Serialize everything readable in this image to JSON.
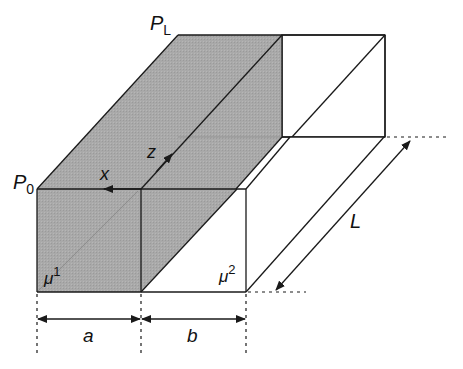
{
  "diagram": {
    "type": "isometric-box-two-regions",
    "colors": {
      "shaded": "#a9a9a9",
      "edge": "#1a1a1a",
      "background": "#ffffff"
    },
    "labels": {
      "p0_main": "P",
      "p0_sub": "0",
      "pl_main": "P",
      "pl_sub": "L",
      "x_axis": "x",
      "z_axis": "z",
      "mu1_main": "μ",
      "mu1_sup": "1",
      "mu2_main": "μ",
      "mu2_sup": "2",
      "width_a": "a",
      "width_b": "b",
      "length": "L"
    },
    "regions": [
      {
        "name": "region-1",
        "material": "μ¹",
        "width_label": "a",
        "shaded": true
      },
      {
        "name": "region-2",
        "material": "μ²",
        "width_label": "b",
        "shaded": false
      }
    ]
  }
}
